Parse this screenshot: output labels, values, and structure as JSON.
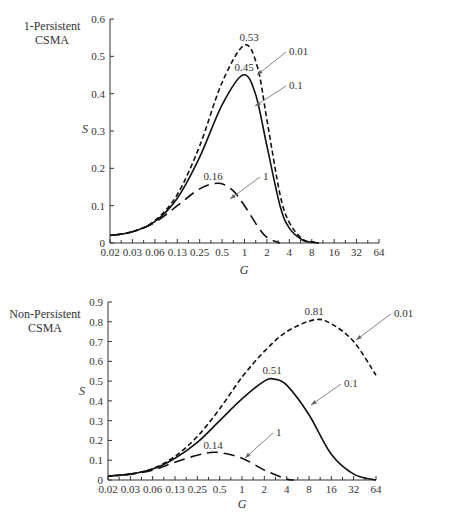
{
  "chart_data": [
    {
      "type": "line",
      "title": "1-Persistent CSMA",
      "title_lines": [
        "1-Persistent",
        "CSMA"
      ],
      "xlabel": "G",
      "ylabel": "S",
      "xscale": "log",
      "x_tick_labels": [
        "0.02",
        "0.03",
        "0.06",
        "0.13",
        "0.25",
        "0.5",
        "1",
        "2",
        "4",
        "8",
        "16",
        "32",
        "64"
      ],
      "y_tick_labels": [
        "0",
        "0.1",
        "0.2",
        "0.3",
        "0.4",
        "0.5",
        "0.6"
      ],
      "ylim": [
        0,
        0.6
      ],
      "grid": false,
      "series": [
        {
          "name": "0.01",
          "style": "dashed",
          "peak_label": "0.53",
          "peak": {
            "G": 1.05,
            "S": 0.53
          },
          "points": [
            [
              0.02,
              0.02
            ],
            [
              0.03,
              0.03
            ],
            [
              0.06,
              0.06
            ],
            [
              0.13,
              0.13
            ],
            [
              0.25,
              0.26
            ],
            [
              0.5,
              0.43
            ],
            [
              1.0,
              0.53
            ],
            [
              1.5,
              0.47
            ],
            [
              2.0,
              0.33
            ],
            [
              3.0,
              0.13
            ],
            [
              4.0,
              0.055
            ],
            [
              6.0,
              0.01
            ],
            [
              8.0,
              0.003
            ],
            [
              10.0,
              0.0
            ]
          ]
        },
        {
          "name": "0.1",
          "style": "solid",
          "peak_label": "0.45",
          "peak": {
            "G": 0.95,
            "S": 0.45
          },
          "points": [
            [
              0.02,
              0.02
            ],
            [
              0.03,
              0.03
            ],
            [
              0.06,
              0.057
            ],
            [
              0.13,
              0.12
            ],
            [
              0.25,
              0.23
            ],
            [
              0.5,
              0.37
            ],
            [
              0.95,
              0.45
            ],
            [
              1.4,
              0.4
            ],
            [
              2.0,
              0.26
            ],
            [
              3.0,
              0.1
            ],
            [
              4.0,
              0.04
            ],
            [
              6.0,
              0.008
            ],
            [
              8.0,
              0.002
            ],
            [
              10.0,
              0.0
            ]
          ]
        },
        {
          "name": "1",
          "style": "long-dashed",
          "peak_label": "0.16",
          "peak": {
            "G": 0.45,
            "S": 0.16
          },
          "points": [
            [
              0.02,
              0.02
            ],
            [
              0.03,
              0.03
            ],
            [
              0.06,
              0.055
            ],
            [
              0.13,
              0.1
            ],
            [
              0.25,
              0.145
            ],
            [
              0.45,
              0.16
            ],
            [
              0.7,
              0.14
            ],
            [
              1.0,
              0.1
            ],
            [
              1.5,
              0.045
            ],
            [
              2.0,
              0.015
            ],
            [
              3.0,
              0.0
            ]
          ]
        }
      ],
      "annotations": [
        {
          "text": "0.53",
          "target": "peak 0.01"
        },
        {
          "text": "0.45",
          "target": "peak 0.1"
        },
        {
          "text": "0.16",
          "target": "peak 1"
        },
        {
          "text": "0.01",
          "arrow_to": "series 0.01"
        },
        {
          "text": "0.1",
          "arrow_to": "series 0.1"
        },
        {
          "text": "1",
          "arrow_to": "series 1"
        }
      ]
    },
    {
      "type": "line",
      "title": "Non-Persistent CSMA",
      "title_lines": [
        "Non-Persistent",
        "CSMA"
      ],
      "xlabel": "G",
      "ylabel": "S",
      "xscale": "log",
      "x_tick_labels": [
        "0.02",
        "0.03",
        "0.06",
        "0.13",
        "0.25",
        "0.5",
        "1",
        "2",
        "4",
        "8",
        "16",
        "32",
        "64"
      ],
      "y_tick_labels": [
        "0",
        "0.1",
        "0.2",
        "0.3",
        "0.4",
        "0.5",
        "0.6",
        "0.7",
        "0.8",
        "0.9"
      ],
      "ylim": [
        0,
        0.9
      ],
      "grid": false,
      "series": [
        {
          "name": "0.01",
          "style": "dashed",
          "peak_label": "0.81",
          "peak": {
            "G": 9.5,
            "S": 0.81
          },
          "points": [
            [
              0.02,
              0.02
            ],
            [
              0.03,
              0.03
            ],
            [
              0.06,
              0.057
            ],
            [
              0.13,
              0.12
            ],
            [
              0.25,
              0.22
            ],
            [
              0.5,
              0.36
            ],
            [
              1.0,
              0.52
            ],
            [
              2.0,
              0.65
            ],
            [
              4.0,
              0.75
            ],
            [
              9.5,
              0.81
            ],
            [
              16.0,
              0.79
            ],
            [
              32.0,
              0.7
            ],
            [
              64.0,
              0.53
            ]
          ]
        },
        {
          "name": "0.1",
          "style": "solid",
          "peak_label": "0.51",
          "peak": {
            "G": 2.7,
            "S": 0.51
          },
          "points": [
            [
              0.02,
              0.02
            ],
            [
              0.03,
              0.03
            ],
            [
              0.06,
              0.055
            ],
            [
              0.13,
              0.11
            ],
            [
              0.25,
              0.19
            ],
            [
              0.5,
              0.3
            ],
            [
              1.0,
              0.41
            ],
            [
              2.0,
              0.5
            ],
            [
              2.7,
              0.51
            ],
            [
              4.0,
              0.48
            ],
            [
              8.0,
              0.33
            ],
            [
              16.0,
              0.13
            ],
            [
              32.0,
              0.03
            ],
            [
              64.0,
              0.0
            ]
          ]
        },
        {
          "name": "1",
          "style": "long-dashed",
          "peak_label": "0.14",
          "peak": {
            "G": 0.45,
            "S": 0.14
          },
          "points": [
            [
              0.02,
              0.02
            ],
            [
              0.03,
              0.03
            ],
            [
              0.06,
              0.05
            ],
            [
              0.13,
              0.09
            ],
            [
              0.25,
              0.125
            ],
            [
              0.45,
              0.14
            ],
            [
              1.0,
              0.11
            ],
            [
              2.0,
              0.05
            ],
            [
              4.0,
              0.005
            ],
            [
              5.0,
              0.0
            ]
          ]
        }
      ],
      "annotations": [
        {
          "text": "0.81",
          "target": "peak 0.01"
        },
        {
          "text": "0.51",
          "target": "peak 0.1"
        },
        {
          "text": "0.14",
          "target": "peak 1"
        },
        {
          "text": "0.01",
          "arrow_to": "series 0.01"
        },
        {
          "text": "0.1",
          "arrow_to": "series 0.1"
        },
        {
          "text": "1",
          "arrow_to": "series 1"
        }
      ]
    }
  ],
  "layout": {
    "panels": [
      {
        "x0": 110,
        "x1": 379,
        "y0": 243,
        "ytop": 19,
        "ymax": 0.6,
        "ylabel_pos": [
          85,
          133
        ],
        "title_pos": [
          52,
          30
        ],
        "xlabel_pos": [
          244,
          274
        ],
        "peak_labels": [
          [
            249,
            41
          ],
          [
            244,
            71
          ],
          [
            213,
            180
          ]
        ],
        "series_labels": [
          [
            [
              289,
              55
            ],
            [
              257,
              75
            ]
          ],
          [
            [
              289,
              89
            ],
            [
              255,
              106
            ]
          ],
          [
            [
              263,
              180
            ],
            [
              230,
              199
            ]
          ]
        ]
      },
      {
        "x0": 108,
        "x1": 376,
        "y0": 480,
        "ytop": 302,
        "ymax": 0.9,
        "ylabel_pos": [
          82,
          395
        ],
        "title_pos": [
          45,
          318
        ],
        "xlabel_pos": [
          242,
          508
        ],
        "peak_labels": [
          [
            314,
            315
          ],
          [
            272,
            374
          ],
          [
            213,
            449
          ]
        ],
        "series_labels": [
          [
            [
              394,
              317
            ],
            [
              356,
              340
            ]
          ],
          [
            [
              344,
              387
            ],
            [
              311,
              405
            ]
          ],
          [
            [
              276,
              436
            ],
            [
              245,
              458
            ]
          ]
        ]
      }
    ],
    "colors": {
      "line": "#111111",
      "axis": "#333333",
      "arrow": "#666666",
      "text": "#333333"
    }
  }
}
